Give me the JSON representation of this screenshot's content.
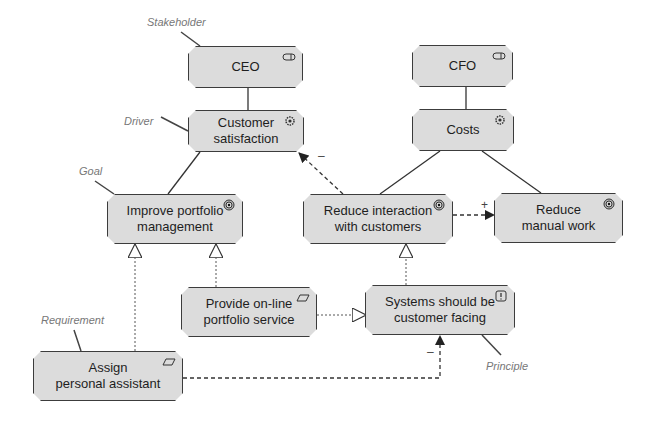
{
  "diagram": {
    "type": "ArchiMate motivation view",
    "nodes": [
      {
        "id": "ceo",
        "label": "CEO",
        "kind": "stakeholder",
        "icon": "stakeholder-icon"
      },
      {
        "id": "customer-satisfaction",
        "label": "Customer\nsatisfaction",
        "kind": "driver",
        "icon": "driver-icon"
      },
      {
        "id": "cfo",
        "label": "CFO",
        "kind": "stakeholder",
        "icon": "stakeholder-icon"
      },
      {
        "id": "costs",
        "label": "Costs",
        "kind": "driver",
        "icon": "driver-icon"
      },
      {
        "id": "improve-portfolio",
        "label": "Improve portfolio\nmanagement",
        "kind": "goal",
        "icon": "goal-icon"
      },
      {
        "id": "reduce-interaction",
        "label": "Reduce interaction\nwith customers",
        "kind": "goal",
        "icon": "goal-icon"
      },
      {
        "id": "reduce-manual-work",
        "label": "Reduce\nmanual work",
        "kind": "goal",
        "icon": "goal-icon"
      },
      {
        "id": "provide-online",
        "label": "Provide on-line\nportfolio service",
        "kind": "requirement",
        "icon": "requirement-icon"
      },
      {
        "id": "systems-customer-facing",
        "label": "Systems should be\ncustomer facing",
        "kind": "principle",
        "icon": "principle-icon"
      },
      {
        "id": "assign-assistant",
        "label": "Assign\npersonal assistant",
        "kind": "requirement",
        "icon": "requirement-icon"
      }
    ],
    "annotations": {
      "stakeholder": "Stakeholder",
      "driver": "Driver",
      "goal": "Goal",
      "requirement": "Requirement",
      "principle": "Principle"
    },
    "edges": [
      {
        "from": "ceo",
        "to": "customer-satisfaction",
        "type": "association"
      },
      {
        "from": "cfo",
        "to": "costs",
        "type": "association"
      },
      {
        "from": "customer-satisfaction",
        "to": "improve-portfolio",
        "type": "association"
      },
      {
        "from": "costs",
        "to": "reduce-interaction",
        "type": "association"
      },
      {
        "from": "costs",
        "to": "reduce-manual-work",
        "type": "association"
      },
      {
        "from": "reduce-interaction",
        "to": "customer-satisfaction",
        "type": "influence",
        "sign": "–"
      },
      {
        "from": "reduce-interaction",
        "to": "reduce-manual-work",
        "type": "influence",
        "sign": "+"
      },
      {
        "from": "assign-assistant",
        "to": "improve-portfolio",
        "type": "realization"
      },
      {
        "from": "provide-online",
        "to": "improve-portfolio",
        "type": "realization"
      },
      {
        "from": "provide-online",
        "to": "systems-customer-facing",
        "type": "realization"
      },
      {
        "from": "systems-customer-facing",
        "to": "reduce-interaction",
        "type": "realization"
      },
      {
        "from": "assign-assistant",
        "to": "systems-customer-facing",
        "type": "influence",
        "sign": "–"
      }
    ]
  },
  "colors": {
    "node_fill": "#dcdcdc",
    "node_border": "#3c3c3c",
    "annotation": "#777777"
  }
}
